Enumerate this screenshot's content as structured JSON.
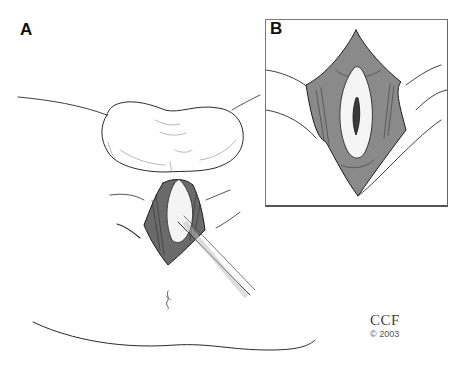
{
  "figure": {
    "panels": [
      {
        "id": "A",
        "label": "A",
        "description": "Overview surgical illustration with retractor"
      },
      {
        "id": "B",
        "label": "B",
        "description": "Inset close-up of exposed surgical field"
      }
    ],
    "credit": {
      "organization": "CCF",
      "copyright": "© 2003"
    },
    "colors": {
      "background": "#ffffff",
      "line": "#222222",
      "shade": "#555555",
      "frame": "#777777"
    }
  }
}
